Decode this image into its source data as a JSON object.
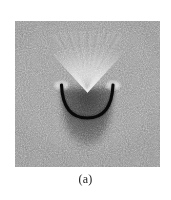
{
  "figure": {
    "caption": "(a)",
    "panel": {
      "label": "speckle-interferogram",
      "background_gray": "#8a8a8a",
      "width_px": 145,
      "height_px": 146
    },
    "features": {
      "arc": {
        "name": "dark-arc",
        "color": "#0d0d0d",
        "description": "thick dark smile-shaped arc"
      },
      "streaks": {
        "name": "radiating-streaks",
        "color": "#e8e8e8",
        "description": "bright fan of fine streaks above the arc"
      },
      "shadow": {
        "name": "dark-lobe-shadow",
        "color": "#4a4a4a",
        "description": "U-shaped darker halo below the arc"
      },
      "endpoint_left": {
        "name": "left-bright-endpoint",
        "color": "#f0f0f0"
      },
      "endpoint_right": {
        "name": "right-bright-endpoint",
        "color": "#f0f0f0"
      }
    }
  },
  "colors": {
    "page_background": "#ffffff",
    "caption_text": "#1a1a1a",
    "speckle_light": "#d8d8d8",
    "speckle_dark": "#3a3a3a"
  }
}
